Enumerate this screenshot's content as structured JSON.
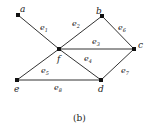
{
  "diagram": {
    "caption": "(b)",
    "nodes": [
      {
        "id": "a",
        "label": "a",
        "x": 18,
        "y": 15
      },
      {
        "id": "b",
        "label": "b",
        "x": 102,
        "y": 16
      },
      {
        "id": "c",
        "label": "c",
        "x": 134,
        "y": 49
      },
      {
        "id": "f",
        "label": "f",
        "x": 59,
        "y": 49
      },
      {
        "id": "e",
        "label": "e",
        "x": 17,
        "y": 80
      },
      {
        "id": "d",
        "label": "d",
        "x": 101,
        "y": 80
      }
    ],
    "edges": [
      {
        "id": "e1",
        "label": "e",
        "sub": "1",
        "from": "a",
        "to": "f"
      },
      {
        "id": "e2",
        "label": "e",
        "sub": "2",
        "from": "f",
        "to": "b"
      },
      {
        "id": "e3",
        "label": "e",
        "sub": "3",
        "from": "f",
        "to": "c"
      },
      {
        "id": "e4",
        "label": "e",
        "sub": "4",
        "from": "f",
        "to": "d"
      },
      {
        "id": "e5",
        "label": "e",
        "sub": "5",
        "from": "e",
        "to": "f"
      },
      {
        "id": "e6",
        "label": "e",
        "sub": "6",
        "from": "b",
        "to": "c"
      },
      {
        "id": "e7",
        "label": "e",
        "sub": "7",
        "from": "c",
        "to": "d"
      },
      {
        "id": "e8",
        "label": "e",
        "sub": "8",
        "from": "e",
        "to": "d"
      }
    ]
  }
}
